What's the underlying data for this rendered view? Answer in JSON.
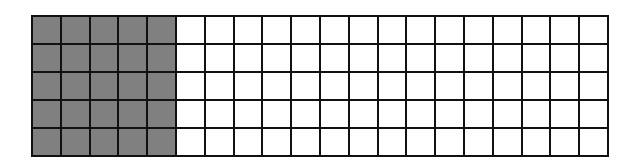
{
  "grid": {
    "rows": 5,
    "columns": 20,
    "shaded_columns": 5,
    "shaded_cells": 25,
    "total_cells": 100,
    "colors": {
      "shaded": "#808080",
      "empty": "#ffffff",
      "line": "#111111"
    }
  }
}
